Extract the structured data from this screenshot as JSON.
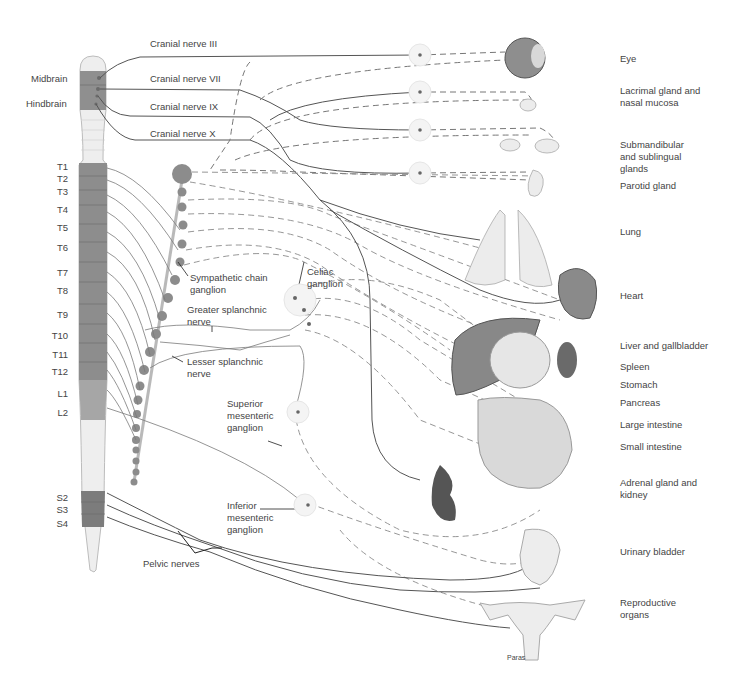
{
  "brain_labels": {
    "midbrain": "Midbrain",
    "hindbrain": "Hindbrain"
  },
  "cranial_nerves": [
    {
      "label": "Cranial nerve III"
    },
    {
      "label": "Cranial nerve VII"
    },
    {
      "label": "Cranial nerve IX"
    },
    {
      "label": "Cranial nerve X"
    }
  ],
  "spinal_segments": [
    "T1",
    "T2",
    "T3",
    "T4",
    "T5",
    "T6",
    "T7",
    "T8",
    "T9",
    "T10",
    "T11",
    "T12",
    "L1",
    "L2",
    "S2",
    "S3",
    "S4"
  ],
  "structure_labels": {
    "sympathetic_chain": "Sympathetic chain ganglion",
    "celiac": "Celiac ganglion",
    "greater_splanchnic": "Greater splanchnic nerve",
    "lesser_splanchnic": "Lesser splanchnic nerve",
    "superior_mesenteric": "Superior mesenteric ganglion",
    "inferior_mesenteric": "Inferior mesenteric ganglion",
    "pelvic_nerves": "Pelvic nerves"
  },
  "organ_labels": [
    "Eye",
    "Lacrimal gland and nasal mucosa",
    "Submandibular and sublingual glands",
    "Parotid gland",
    "Lung",
    "Heart",
    "Liver and gallbladder",
    "Spleen",
    "Stomach",
    "Pancreas",
    "Large intestine",
    "Small intestine",
    "Adrenal gland and kidney",
    "Urinary bladder",
    "Reproductive organs"
  ],
  "footer_text": "Paras",
  "colors": {
    "cord_dark": "#8a8a8a",
    "cord_light": "#e8e8e8",
    "nerve": "#555555",
    "ganglion": "#8c8c8c"
  }
}
